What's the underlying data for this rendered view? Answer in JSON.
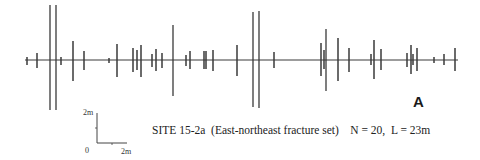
{
  "panel_label": "A",
  "caption": {
    "site": "SITE 15-2a",
    "set": "(East-northeast fracture set)",
    "stats": "N = 20,  L = 23m"
  },
  "scale_bar": {
    "vertical_label": "2m",
    "origin_label": "0",
    "horizontal_label": "2m"
  },
  "colors": {
    "ink": "#3a3a3a",
    "background": "#ffffff"
  },
  "chart_data": {
    "type": "scanline",
    "title": "SITE 15-2a (East-northeast fracture set)",
    "annotations": [
      "N = 20",
      "L = 23m",
      "A"
    ],
    "scanline": {
      "x_start": 25,
      "x_end": 458,
      "y": 60
    },
    "fractures_px": [
      {
        "x": 27,
        "top": 57,
        "bottom": 65
      },
      {
        "x": 37,
        "top": 53,
        "bottom": 68
      },
      {
        "x": 50,
        "top": 5,
        "bottom": 110
      },
      {
        "x": 56,
        "top": 5,
        "bottom": 110
      },
      {
        "x": 61,
        "top": 57,
        "bottom": 65
      },
      {
        "x": 73,
        "top": 41,
        "bottom": 81
      },
      {
        "x": 84,
        "top": 51,
        "bottom": 70
      },
      {
        "x": 109,
        "top": 58,
        "bottom": 63
      },
      {
        "x": 117,
        "top": 44,
        "bottom": 77
      },
      {
        "x": 133,
        "top": 48,
        "bottom": 72
      },
      {
        "x": 137,
        "top": 50,
        "bottom": 70
      },
      {
        "x": 141,
        "top": 45,
        "bottom": 77
      },
      {
        "x": 152,
        "top": 54,
        "bottom": 67
      },
      {
        "x": 156,
        "top": 49,
        "bottom": 71
      },
      {
        "x": 162,
        "top": 53,
        "bottom": 68
      },
      {
        "x": 173,
        "top": 25,
        "bottom": 96
      },
      {
        "x": 186,
        "top": 55,
        "bottom": 66
      },
      {
        "x": 190,
        "top": 51,
        "bottom": 69
      },
      {
        "x": 204,
        "top": 51,
        "bottom": 69
      },
      {
        "x": 206,
        "top": 51,
        "bottom": 69
      },
      {
        "x": 213,
        "top": 50,
        "bottom": 71
      },
      {
        "x": 237,
        "top": 45,
        "bottom": 76
      },
      {
        "x": 253,
        "top": 12,
        "bottom": 107
      },
      {
        "x": 259,
        "top": 11,
        "bottom": 108
      },
      {
        "x": 274,
        "top": 52,
        "bottom": 68
      },
      {
        "x": 321,
        "top": 43,
        "bottom": 76
      },
      {
        "x": 324,
        "top": 50,
        "bottom": 69
      },
      {
        "x": 326,
        "top": 29,
        "bottom": 91
      },
      {
        "x": 338,
        "top": 38,
        "bottom": 81
      },
      {
        "x": 349,
        "top": 48,
        "bottom": 72
      },
      {
        "x": 371,
        "top": 54,
        "bottom": 65
      },
      {
        "x": 374,
        "top": 40,
        "bottom": 79
      },
      {
        "x": 381,
        "top": 49,
        "bottom": 70
      },
      {
        "x": 407,
        "top": 53,
        "bottom": 67
      },
      {
        "x": 411,
        "top": 45,
        "bottom": 74
      },
      {
        "x": 413,
        "top": 54,
        "bottom": 65
      },
      {
        "x": 417,
        "top": 48,
        "bottom": 71
      },
      {
        "x": 434,
        "top": 57,
        "bottom": 63
      },
      {
        "x": 444,
        "top": 54,
        "bottom": 65
      },
      {
        "x": 455,
        "top": 48,
        "bottom": 71
      }
    ],
    "scale": {
      "vertical_m": 2,
      "horizontal_m": 2,
      "px_per_2m": 30
    }
  }
}
